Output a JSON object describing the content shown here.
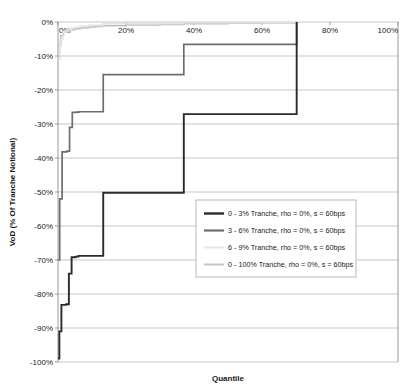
{
  "chart_data": {
    "type": "line",
    "title": "",
    "xlabel": "Quantile",
    "ylabel": "VoD (% Of Tranche Notional)",
    "xlim": [
      0,
      100
    ],
    "ylim": [
      -100,
      0
    ],
    "xticks": [
      "0%",
      "20%",
      "40%",
      "60%",
      "80%",
      "100%"
    ],
    "xtick_values": [
      0,
      20,
      40,
      60,
      80,
      100
    ],
    "yticks": [
      "0%",
      "-10%",
      "-20%",
      "-30%",
      "-40%",
      "-50%",
      "-60%",
      "-70%",
      "-80%",
      "-90%",
      "-100%"
    ],
    "ytick_values": [
      0,
      -10,
      -20,
      -30,
      -40,
      -50,
      -60,
      -70,
      -80,
      -90,
      -100
    ],
    "grid": true,
    "legend_position": "center-right",
    "series": [
      {
        "name": "0 - 3% Tranche, rho = 0%, s = 60bps",
        "color": "#2b2b2b",
        "width": 1.9,
        "x": [
          0.0,
          0.4,
          1.0,
          1.6,
          2.4,
          3.2,
          4.0,
          5.2,
          6.0,
          13.0,
          13.3,
          36.7,
          37.0,
          69.8,
          70.2
        ],
        "y": [
          -99.0,
          -91.0,
          -83.2,
          -83.2,
          -83.0,
          -74.0,
          -69.2,
          -69.0,
          -68.8,
          -68.8,
          -50.2,
          -50.2,
          -27.1,
          -27.1,
          0.0
        ]
      },
      {
        "name": "3 - 6% Tranche, rho = 0%, s = 60bps",
        "color": "#6e6e6e",
        "width": 1.7,
        "x": [
          0.0,
          0.5,
          1.2,
          1.8,
          2.6,
          3.4,
          4.2,
          5.4,
          6.2,
          13.0,
          13.3,
          36.7,
          37.0,
          69.8,
          70.2
        ],
        "y": [
          -70.0,
          -52.0,
          -38.2,
          -38.2,
          -38.0,
          -31.0,
          -26.6,
          -26.5,
          -26.4,
          -26.4,
          -15.5,
          -15.5,
          -6.6,
          -6.6,
          0.0
        ]
      },
      {
        "name": "6 - 9% Tranche, rho = 0%, s = 60bps",
        "color": "#e2e2e2",
        "width": 1.7,
        "x": [
          0.0,
          0.6,
          1.4,
          2.2,
          3.0,
          4.0,
          5.0,
          6.5,
          9.0,
          13.0,
          13.4,
          36.8,
          70.2
        ],
        "y": [
          -11.0,
          -5.0,
          -3.0,
          -2.6,
          -2.2,
          -1.9,
          -1.6,
          -1.3,
          -1.0,
          -1.0,
          -0.5,
          -0.2,
          0.0
        ]
      },
      {
        "name": "0 - 100% Tranche, rho = 0%, s = 60bps",
        "color": "#bdbdbd",
        "width": 1.5,
        "x": [
          0.0,
          0.8,
          1.6,
          2.6,
          3.6,
          5.0,
          6.6,
          9.0,
          11.0,
          13.2,
          20.0,
          30.0,
          37.0,
          50.0,
          60.0,
          70.2
        ],
        "y": [
          -7.0,
          -4.0,
          -3.0,
          -2.6,
          -2.3,
          -2.0,
          -1.8,
          -1.5,
          -1.3,
          -1.1,
          -0.9,
          -0.7,
          -0.55,
          -0.4,
          -0.3,
          0.0
        ]
      }
    ]
  },
  "legend": {
    "items": [
      {
        "label": "0 - 3% Tranche, rho = 0%, s = 60bps",
        "color": "#2b2b2b",
        "width": 2.4
      },
      {
        "label": "3 - 6% Tranche, rho = 0%, s = 60bps",
        "color": "#6e6e6e",
        "width": 2.2
      },
      {
        "label": "6 - 9% Tranche, rho = 0%, s = 60bps",
        "color": "#e6e6e6",
        "width": 2.0
      },
      {
        "label": "0 - 100% Tranche, rho = 0%, s = 60bps",
        "color": "#c4c4c4",
        "width": 2.0
      }
    ]
  },
  "axes": {
    "x_title": "Quantile",
    "y_title": "VoD (% Of Tranche Notional)"
  },
  "colors": {
    "background": "#ffffff",
    "grid": "#b0b0b0",
    "axis": "#808080",
    "text": "#1a1a1a"
  }
}
